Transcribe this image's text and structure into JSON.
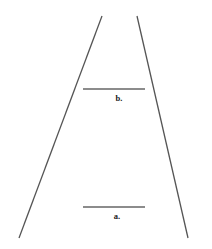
{
  "diagram": {
    "lines": [
      {
        "id": "b",
        "label": "b."
      },
      {
        "id": "a",
        "label": "a."
      }
    ],
    "colors": {
      "rail": "#555555",
      "bar": "#666666",
      "label": "#222222",
      "background": "#ffffff"
    }
  }
}
